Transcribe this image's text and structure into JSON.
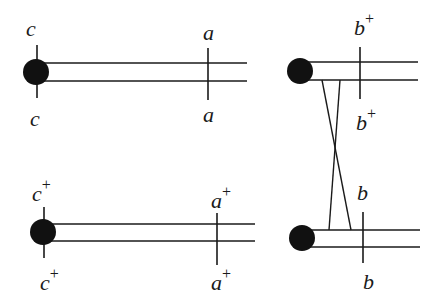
{
  "diagram": {
    "colors": {
      "stroke": "#1a1a1a",
      "node": "#111111",
      "background": "#ffffff"
    },
    "components": [
      {
        "id": "top-left",
        "top_marker_label": "c",
        "top_marker_sup": "",
        "bottom_marker_label": "c",
        "bottom_marker_sup": "",
        "end_top_label": "a",
        "end_top_sup": "",
        "end_bottom_label": "a",
        "end_bottom_sup": ""
      },
      {
        "id": "bottom-left",
        "top_marker_label": "c",
        "top_marker_sup": "+",
        "bottom_marker_label": "c",
        "bottom_marker_sup": "+",
        "end_top_label": "a",
        "end_top_sup": "+",
        "end_bottom_label": "a",
        "end_bottom_sup": "+"
      },
      {
        "id": "top-right",
        "end_top_label": "b",
        "end_top_sup": "+",
        "end_bottom_label": "b",
        "end_bottom_sup": "+"
      },
      {
        "id": "bottom-right",
        "end_top_label": "b",
        "end_top_sup": "",
        "end_bottom_label": "b",
        "end_bottom_sup": ""
      }
    ]
  }
}
